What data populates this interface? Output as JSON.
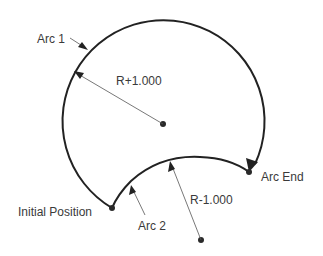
{
  "diagram": {
    "labels": {
      "arc1": "Arc 1",
      "arc2": "Arc 2",
      "radius_plus": "R+1.000",
      "radius_minus": "R-1.000",
      "arc_end": "Arc End",
      "initial_position": "Initial Position"
    },
    "colors": {
      "curve": "#222222",
      "leader": "#555555",
      "text": "#3a3a3a",
      "background": "#ffffff"
    }
  }
}
